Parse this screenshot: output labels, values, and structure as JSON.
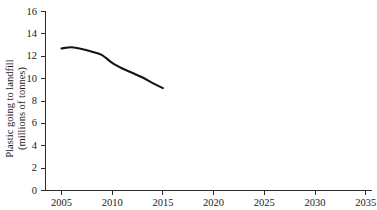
{
  "chart_data": {
    "type": "line",
    "title": "",
    "xlabel": "",
    "ylabel": "Plastic going to landfill (millions of tonnes)",
    "ylabel_line1": "Plastic going to landfill",
    "ylabel_line2": "(millions of tonnes)",
    "xlim": [
      2003.8,
      2036.5
    ],
    "ylim": [
      0,
      16
    ],
    "grid": false,
    "legend": null,
    "xticks": [
      "2005",
      "2010",
      "2015",
      "2020",
      "2025",
      "2030",
      "2035"
    ],
    "xtick_values": [
      2005,
      2010,
      2015,
      2020,
      2025,
      2030,
      2035
    ],
    "yticks": [
      "0",
      "2",
      "4",
      "6",
      "8",
      "10",
      "12",
      "14",
      "16"
    ],
    "ytick_values": [
      0,
      2,
      4,
      6,
      8,
      10,
      12,
      14,
      16
    ],
    "series": [
      {
        "name": "Plastic going to landfill",
        "color": "#141414",
        "x": [
          2005,
          2006,
          2007,
          2008,
          2009,
          2010,
          2011,
          2012,
          2013,
          2014,
          2015
        ],
        "values": [
          12.7,
          12.8,
          12.65,
          12.4,
          12.1,
          11.4,
          10.9,
          10.5,
          10.1,
          9.6,
          9.15
        ]
      }
    ],
    "annotations": []
  },
  "axes": {
    "y_axis_name": "y-axis",
    "x_axis_name": "x-axis"
  },
  "header": {
    "title_remnant": ""
  }
}
